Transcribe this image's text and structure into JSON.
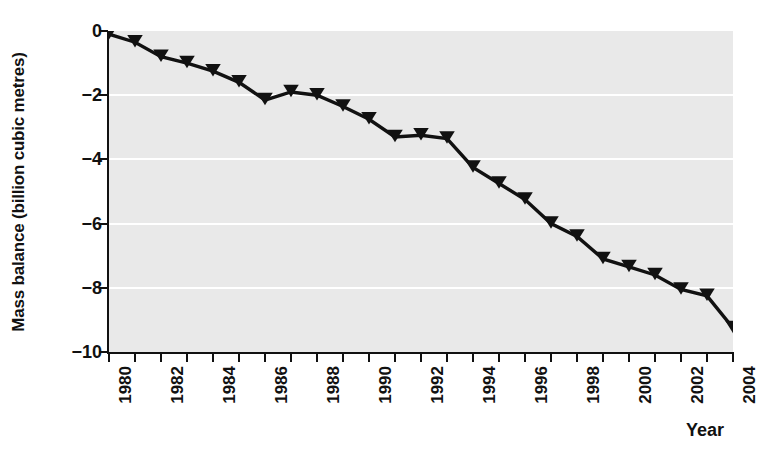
{
  "chart_data": {
    "type": "line",
    "title": "",
    "subtitle": "",
    "xlabel": "Year",
    "ylabel": "Mass balance (billion cubic metres)",
    "xlim": [
      1980,
      2004
    ],
    "ylim": [
      -10,
      0
    ],
    "xticks": [
      1980,
      1982,
      1984,
      1986,
      1988,
      1990,
      1992,
      1994,
      1996,
      1998,
      2000,
      2002,
      2004
    ],
    "xtick_labels": [
      "1980",
      "1982",
      "1984",
      "1986",
      "1988",
      "1990",
      "1992",
      "1994",
      "1996",
      "1998",
      "2000",
      "2002",
      "2004"
    ],
    "xtick_minor": [
      1981,
      1983,
      1985,
      1987,
      1989,
      1991,
      1993,
      1995,
      1997,
      1999,
      2001,
      2003
    ],
    "yticks": [
      0,
      -2,
      -4,
      -6,
      -8,
      -10
    ],
    "ytick_labels": [
      "0",
      "−2",
      "−4",
      "−6",
      "−8",
      "−10"
    ],
    "grid": "horizontal",
    "grid_color": "#ffffff",
    "plot_background": "#e9e9e9",
    "line_color": "#111111",
    "marker": "triangle-down",
    "marker_color": "#111111",
    "legend": "none",
    "x": [
      1980,
      1981,
      1982,
      1983,
      1984,
      1985,
      1986,
      1987,
      1988,
      1989,
      1990,
      1991,
      1992,
      1993,
      1994,
      1995,
      1996,
      1997,
      1998,
      1999,
      2000,
      2001,
      2002,
      2003,
      2004
    ],
    "series": [
      {
        "name": "Mass balance",
        "values": [
          -0.1,
          -0.35,
          -0.8,
          -1.0,
          -1.25,
          -1.6,
          -2.15,
          -1.9,
          -2.0,
          -2.35,
          -2.75,
          -3.3,
          -3.25,
          -3.35,
          -4.25,
          -4.75,
          -5.25,
          -6.0,
          -6.4,
          -7.1,
          -7.35,
          -7.6,
          -8.05,
          -8.25,
          -9.25
        ]
      }
    ]
  }
}
